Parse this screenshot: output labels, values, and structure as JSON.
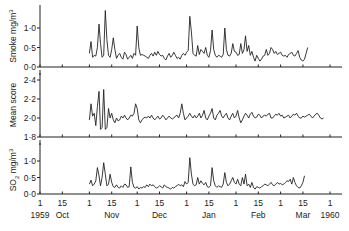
{
  "chart_data": [
    {
      "type": "line",
      "panel": "top",
      "title": "",
      "ylabel": "Smoke mg/m3",
      "ylim": [
        0.0,
        1.4
      ],
      "yticks": [
        "0.0",
        "0.5",
        "1.0"
      ],
      "series": [
        {
          "name": "Smoke",
          "x_day": [
            31,
            32,
            33,
            34,
            35,
            36,
            37,
            38,
            39,
            40,
            41,
            42,
            43,
            44,
            45,
            46,
            47,
            48,
            49,
            50,
            51,
            52,
            53,
            54,
            55,
            56,
            57,
            58,
            59,
            60,
            61,
            62,
            63,
            64,
            65,
            66,
            67,
            68,
            69,
            70,
            71,
            72,
            73,
            74,
            75,
            76,
            77,
            78,
            79,
            80,
            81,
            82,
            83,
            84,
            85,
            86,
            87,
            88,
            89,
            90,
            91,
            92,
            93,
            94,
            95,
            96,
            97,
            98,
            99,
            100,
            101,
            102,
            103,
            104,
            105,
            106,
            107,
            108,
            109,
            110,
            111,
            112,
            113,
            114,
            115,
            116,
            117,
            118,
            119,
            120,
            121,
            122,
            123,
            124,
            125,
            126,
            127,
            128,
            129,
            130,
            131,
            132,
            133,
            134,
            135,
            136,
            137,
            138,
            139,
            140,
            141,
            142,
            143,
            144,
            145,
            146,
            147,
            148,
            149,
            150,
            151,
            152,
            153,
            154,
            155,
            156,
            157,
            158,
            159,
            160,
            161,
            162,
            163,
            164,
            165,
            166,
            167,
            168,
            169,
            170,
            171,
            172,
            173,
            174,
            175,
            176,
            177,
            178,
            179,
            180,
            181,
            182
          ],
          "values": [
            0.35,
            0.65,
            0.25,
            0.3,
            0.28,
            0.5,
            1.1,
            0.6,
            0.25,
            0.3,
            1.45,
            0.7,
            0.3,
            0.25,
            0.45,
            0.75,
            0.45,
            0.22,
            0.3,
            0.35,
            0.25,
            0.2,
            0.38,
            0.32,
            0.2,
            0.25,
            0.3,
            0.22,
            0.35,
            0.3,
            1.05,
            0.5,
            0.3,
            0.32,
            0.3,
            0.28,
            0.25,
            0.22,
            0.3,
            0.35,
            0.28,
            0.38,
            0.3,
            0.4,
            0.32,
            0.28,
            0.3,
            0.22,
            0.18,
            0.28,
            0.35,
            0.25,
            0.3,
            0.38,
            0.3,
            0.22,
            0.25,
            0.2,
            0.3,
            0.35,
            0.3,
            0.38,
            0.42,
            1.3,
            0.9,
            0.35,
            0.3,
            0.28,
            0.55,
            0.32,
            0.45,
            0.4,
            0.35,
            0.5,
            0.3,
            0.25,
            0.42,
            0.95,
            0.45,
            0.3,
            0.25,
            0.3,
            0.28,
            0.25,
            0.32,
            1.0,
            0.45,
            0.3,
            0.28,
            0.35,
            0.6,
            0.4,
            0.38,
            0.3,
            0.32,
            0.6,
            0.35,
            0.45,
            0.8,
            0.4,
            0.55,
            0.3,
            0.4,
            0.25,
            0.15,
            0.3,
            0.22,
            0.15,
            0.2,
            0.28,
            0.3,
            0.45,
            0.3,
            0.35,
            0.5,
            0.45,
            0.35,
            0.4,
            0.32,
            0.35,
            0.38,
            0.3,
            0.28,
            0.3,
            0.25,
            0.32,
            0.35,
            0.38,
            0.3,
            0.28,
            0.35,
            0.42,
            0.25,
            0.18,
            0.15,
            0.2,
            0.35,
            0.5
          ],
          "approx": true
        }
      ]
    },
    {
      "type": "line",
      "panel": "middle",
      "ylabel": "Mean score",
      "ylim": [
        1.8,
        2.45
      ],
      "yticks": [
        "1.8",
        "2.0",
        "2.2",
        "2.4"
      ],
      "series": [
        {
          "name": "Mean score",
          "x_day": [
            31,
            32,
            33,
            34,
            35,
            36,
            37,
            38,
            39,
            40,
            41,
            42,
            43,
            44,
            45,
            46,
            47,
            48,
            49,
            50,
            51,
            52,
            53,
            54,
            55,
            56,
            57,
            58,
            59,
            60,
            61,
            62,
            63,
            64,
            65,
            66,
            67,
            68,
            69,
            70,
            71,
            72,
            73,
            74,
            75,
            76,
            77,
            78,
            79,
            80,
            81,
            82,
            83,
            84,
            85,
            86,
            87,
            88,
            89,
            90,
            91,
            92,
            93,
            94,
            95,
            96,
            97,
            98,
            99,
            100,
            101,
            102,
            103,
            104,
            105,
            106,
            107,
            108,
            109,
            110,
            111,
            112,
            113,
            114,
            115,
            116,
            117,
            118,
            119,
            120,
            121,
            122,
            123,
            124,
            125,
            126,
            127,
            128,
            129,
            130,
            131,
            132,
            133,
            134,
            135,
            136,
            137,
            138,
            139,
            140,
            141,
            142,
            143,
            144,
            145,
            146,
            147,
            148,
            149,
            150,
            151,
            152,
            153,
            154,
            155,
            156,
            157,
            158,
            159,
            160,
            161,
            162,
            163,
            164,
            165,
            166,
            167,
            168,
            169,
            170,
            171,
            172,
            173,
            174,
            175,
            176,
            177,
            178,
            179,
            180
          ],
          "values": [
            1.98,
            2.15,
            2.02,
            2.05,
            1.92,
            2.12,
            2.28,
            1.88,
            1.9,
            2.3,
            1.88,
            1.9,
            2.1,
            2.0,
            2.05,
            1.98,
            1.95,
            2.0,
            1.97,
            1.98,
            2.02,
            2.0,
            2.03,
            2.0,
            1.98,
            2.0,
            2.03,
            2.02,
            2.05,
            2.15,
            2.1,
            1.98,
            1.95,
            1.98,
            2.0,
            2.01,
            2.0,
            2.02,
            2.0,
            2.03,
            2.0,
            1.98,
            2.0,
            2.02,
            1.99,
            2.0,
            2.03,
            2.01,
            1.98,
            2.0,
            2.02,
            2.0,
            1.99,
            2.0,
            2.02,
            2.03,
            2.0,
            2.05,
            2.15,
            2.05,
            1.98,
            2.0,
            2.02,
            2.05,
            2.02,
            2.0,
            2.03,
            2.0,
            2.02,
            2.05,
            2.0,
            2.03,
            2.08,
            2.0,
            1.98,
            2.02,
            2.05,
            2.1,
            2.0,
            1.98,
            2.03,
            2.05,
            2.08,
            2.02,
            2.0,
            2.03,
            2.05,
            2.0,
            1.98,
            2.02,
            2.05,
            2.0,
            2.02,
            2.08,
            2.0,
            1.95,
            1.98,
            2.02,
            2.05,
            2.03,
            2.0,
            2.04,
            2.06,
            2.02,
            2.0,
            2.01,
            2.04,
            2.03,
            2.0,
            2.02,
            2.03,
            2.02,
            2.04,
            2.05,
            2.0,
            2.0,
            2.02,
            2.04,
            2.03,
            2.05,
            2.02,
            2.03,
            2.0,
            2.01,
            2.02,
            2.03,
            2.0,
            2.02,
            2.04,
            2.03,
            2.05,
            2.02,
            2.0,
            2.0,
            2.02,
            2.01,
            2.02,
            2.03,
            2.04,
            2.02,
            2.0,
            2.02,
            2.04,
            2.05,
            2.03,
            2.0,
            1.99,
            2.0
          ],
          "approx": true
        }
      ]
    },
    {
      "type": "line",
      "panel": "bottom",
      "ylabel": "SO2 mg/m3",
      "ylim": [
        0.0,
        1.4
      ],
      "yticks": [
        "0.0",
        "0.5",
        "1.0"
      ],
      "series": [
        {
          "name": "SO2",
          "x_day": [
            31,
            32,
            33,
            34,
            35,
            36,
            37,
            38,
            39,
            40,
            41,
            42,
            43,
            44,
            45,
            46,
            47,
            48,
            49,
            50,
            51,
            52,
            53,
            54,
            55,
            56,
            57,
            58,
            59,
            60,
            61,
            62,
            63,
            64,
            65,
            66,
            67,
            68,
            69,
            70,
            71,
            72,
            73,
            74,
            75,
            76,
            77,
            78,
            79,
            80,
            81,
            82,
            83,
            84,
            85,
            86,
            87,
            88,
            89,
            90,
            91,
            92,
            93,
            94,
            95,
            96,
            97,
            98,
            99,
            100,
            101,
            102,
            103,
            104,
            105,
            106,
            107,
            108,
            109,
            110,
            111,
            112,
            113,
            114,
            115,
            116,
            117,
            118,
            119,
            120,
            121,
            122,
            123,
            124,
            125,
            126,
            127,
            128,
            129,
            130,
            131,
            132,
            133,
            134,
            135,
            136,
            137,
            138,
            139,
            140,
            141,
            142,
            143,
            144,
            145,
            146,
            147,
            148,
            149,
            150,
            151,
            152,
            153,
            154,
            155,
            156,
            157,
            158,
            159,
            160,
            161,
            162,
            163,
            164,
            165,
            166,
            167,
            168,
            169,
            170,
            171,
            172,
            173,
            174,
            175,
            176,
            177,
            178,
            179,
            180,
            181,
            182
          ],
          "values": [
            0.3,
            0.42,
            0.25,
            0.3,
            0.4,
            0.8,
            0.55,
            0.25,
            0.5,
            0.95,
            0.6,
            0.25,
            0.3,
            0.6,
            0.35,
            0.22,
            0.2,
            0.28,
            0.2,
            0.18,
            0.25,
            0.2,
            0.3,
            0.28,
            0.2,
            0.22,
            0.82,
            0.35,
            0.2,
            0.18,
            0.22,
            0.15,
            0.2,
            0.18,
            0.22,
            0.2,
            0.28,
            0.22,
            0.3,
            0.25,
            0.28,
            0.22,
            0.18,
            0.2,
            0.25,
            0.22,
            0.18,
            0.28,
            0.22,
            0.2,
            0.18,
            0.15,
            0.2,
            0.18,
            0.22,
            0.25,
            0.3,
            0.25,
            0.28,
            0.22,
            0.38,
            0.3,
            0.35,
            1.1,
            0.6,
            0.3,
            0.25,
            0.28,
            0.5,
            0.3,
            0.4,
            0.32,
            0.28,
            0.35,
            0.22,
            0.2,
            0.25,
            0.8,
            0.4,
            0.25,
            0.2,
            0.25,
            0.22,
            0.2,
            0.3,
            0.65,
            0.35,
            0.25,
            0.3,
            0.4,
            0.5,
            0.35,
            0.3,
            0.45,
            0.3,
            0.25,
            0.5,
            0.3,
            0.6,
            0.25,
            0.3,
            0.2,
            0.35,
            0.2,
            0.15,
            0.22,
            0.2,
            0.18,
            0.22,
            0.25,
            0.3,
            0.28,
            0.25,
            0.3,
            0.35,
            0.28,
            0.25,
            0.3,
            0.35,
            0.3,
            0.32,
            0.28,
            0.3,
            0.35,
            0.4,
            0.38,
            0.45,
            0.3,
            0.5,
            0.35,
            0.25,
            0.2,
            0.18,
            0.25,
            0.35,
            0.55
          ],
          "approx": true
        }
      ]
    }
  ],
  "x_axis": {
    "tick_numbers": [
      "1",
      "15",
      "1",
      "15",
      "1",
      "15",
      "1",
      "15",
      "1",
      "15",
      "1",
      "15",
      "1"
    ],
    "month_labels": [
      "1959",
      "Oct",
      "Nov",
      "Dec",
      "Jan",
      "Feb",
      "Mar",
      "1960"
    ],
    "range_days": [
      0,
      182
    ],
    "origin_date": "1 Oct 1959"
  },
  "panels": {
    "top": {
      "ylabel": "Smoke mg/m",
      "ylabel_sup": "3",
      "ticks": [
        "1·0",
        "0·5",
        "0·0"
      ]
    },
    "middle": {
      "ylabel": "Mean score",
      "ticks": [
        "2·4",
        "2·2",
        "2·0",
        "1·8"
      ]
    },
    "bottom": {
      "ylabel_prefix": "SO",
      "ylabel_sub": "2",
      "ylabel_suffix": " mg/m",
      "ylabel_sup": "3",
      "ticks": [
        "1·0",
        "0·5",
        "0·0"
      ]
    }
  },
  "style": {
    "line_color": "#222222",
    "axis_color": "#222222",
    "background": "#ffffff"
  }
}
